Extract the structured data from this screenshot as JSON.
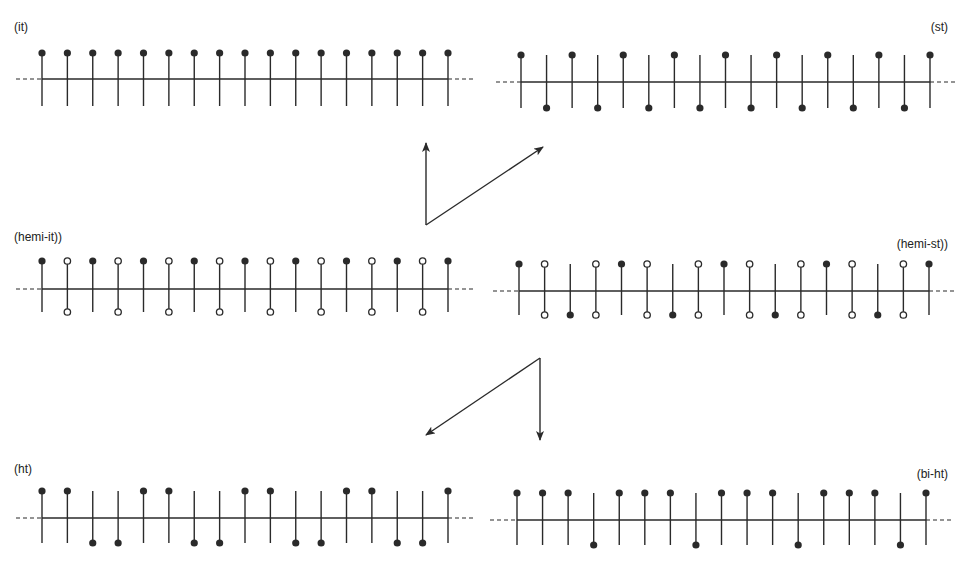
{
  "colors": {
    "ink": "#2a2a2a",
    "background": "#ffffff"
  },
  "panels": [
    {
      "id": "it",
      "label": "(it)",
      "label_pos": {
        "x": 14,
        "y": 20,
        "align": "left"
      },
      "x0": 42,
      "x1": 448,
      "axis_y": 79,
      "up_y": 53,
      "down_y": 106,
      "dash_left": 16,
      "dash_right": 474,
      "stems": [
        "F",
        "F",
        "F",
        "F",
        "F",
        "F",
        "F",
        "F",
        "F",
        "F",
        "F",
        "F",
        "F",
        "F",
        "F",
        "F",
        "F"
      ]
    },
    {
      "id": "st",
      "label": "(st)",
      "label_pos": {
        "x": 948,
        "y": 20,
        "align": "right"
      },
      "x0": 521,
      "x1": 930,
      "axis_y": 82,
      "up_y": 55,
      "down_y": 108,
      "dash_left": 496,
      "dash_right": 956,
      "stems": [
        "F",
        "f",
        "F",
        "f",
        "F",
        "f",
        "F",
        "f",
        "F",
        "f",
        "F",
        "f",
        "F",
        "f",
        "F",
        "f",
        "F"
      ]
    },
    {
      "id": "hemi-it",
      "label": "(hemi-it))",
      "label_pos": {
        "x": 14,
        "y": 230,
        "align": "left"
      },
      "x0": 42,
      "x1": 448,
      "axis_y": 289,
      "up_y": 261,
      "down_y": 312,
      "dash_left": 16,
      "dash_right": 474,
      "stems": [
        "F",
        "O",
        "F",
        "O",
        "F",
        "O",
        "F",
        "O",
        "F",
        "O",
        "F",
        "O",
        "F",
        "O",
        "F",
        "O",
        "F"
      ]
    },
    {
      "id": "hemi-st",
      "label": "(hemi-st))",
      "label_pos": {
        "x": 948,
        "y": 237,
        "align": "right"
      },
      "x0": 519,
      "x1": 929,
      "axis_y": 291,
      "up_y": 264,
      "down_y": 315,
      "dash_left": 493,
      "dash_right": 955,
      "stems": [
        "F",
        "O",
        "f",
        "O",
        "F",
        "O",
        "f",
        "O",
        "F",
        "O",
        "f",
        "O",
        "F",
        "O",
        "f",
        "O",
        "F"
      ]
    },
    {
      "id": "ht",
      "label": "(ht)",
      "label_pos": {
        "x": 14,
        "y": 462,
        "align": "left"
      },
      "x0": 42,
      "x1": 448,
      "axis_y": 518,
      "up_y": 491,
      "down_y": 543,
      "dash_left": 16,
      "dash_right": 474,
      "stems": [
        "F",
        "F",
        "f",
        "f",
        "F",
        "F",
        "f",
        "f",
        "F",
        "F",
        "f",
        "f",
        "F",
        "F",
        "f",
        "f",
        "F"
      ]
    },
    {
      "id": "bi-ht",
      "label": "(bi-ht)",
      "label_pos": {
        "x": 948,
        "y": 467,
        "align": "right"
      },
      "x0": 517,
      "x1": 926,
      "axis_y": 520,
      "up_y": 493,
      "down_y": 545,
      "dash_left": 490,
      "dash_right": 952,
      "stems": [
        "F",
        "F",
        "F",
        "f",
        "F",
        "F",
        "F",
        "f",
        "F",
        "F",
        "F",
        "f",
        "F",
        "F",
        "F",
        "f",
        "F"
      ]
    }
  ],
  "stem_legend": {
    "F": "filled dot above axis",
    "f": "filled dot below axis",
    "O": "open dots above and below axis"
  },
  "arrows": [
    {
      "id": "arrow-up-vertical",
      "from": [
        426,
        225
      ],
      "to": [
        426,
        143
      ]
    },
    {
      "id": "arrow-up-diagonal",
      "from": [
        426,
        225
      ],
      "to": [
        543,
        147
      ]
    },
    {
      "id": "arrow-down-diagonal",
      "from": [
        540,
        358
      ],
      "to": [
        426,
        435
      ]
    },
    {
      "id": "arrow-down-vertical",
      "from": [
        540,
        358
      ],
      "to": [
        540,
        440
      ]
    }
  ]
}
